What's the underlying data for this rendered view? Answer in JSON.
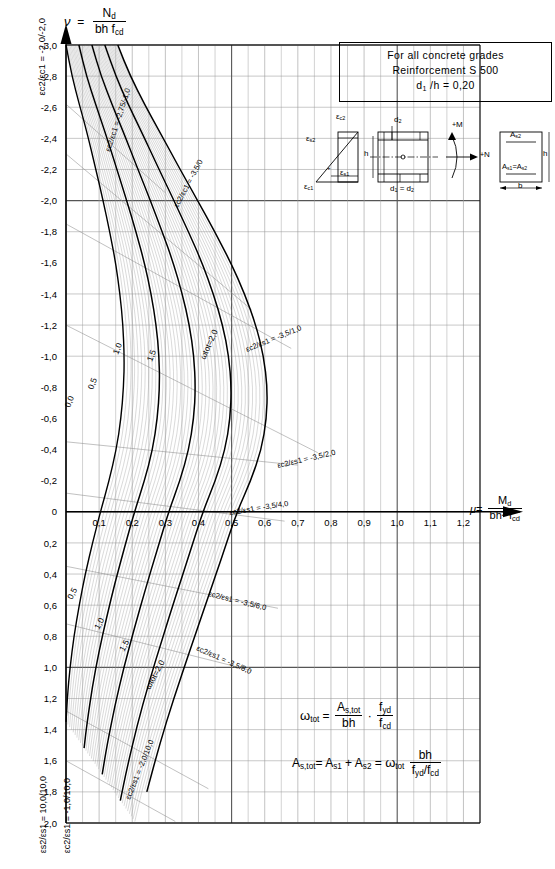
{
  "chart_data": {
    "type": "line",
    "xlabel": "mu = Md / (b h^2 fcd)",
    "ylabel": "nu = Nd / (b h fcd)",
    "xlim": [
      0,
      1.25
    ],
    "ylim": [
      -3.0,
      2.0
    ],
    "grid": true,
    "x_ticks": [
      "0,1",
      "0,2",
      "0,3",
      "0,4",
      "0,5",
      "0,6",
      "0,7",
      "0,8",
      "0,9",
      "1,0",
      "1,1",
      "1,2"
    ],
    "x_tick_values": [
      0.1,
      0.2,
      0.3,
      0.4,
      0.5,
      0.6,
      0.7,
      0.8,
      0.9,
      1.0,
      1.1,
      1.2
    ],
    "y_ticks": [
      "-3,0",
      "-2,8",
      "-2,6",
      "-2,4",
      "-2,2",
      "-2,0",
      "-1,8",
      "-1,6",
      "-1,4",
      "-1,2",
      "-1,0",
      "-0,8",
      "-0,6",
      "-0,4",
      "-0,2",
      "0",
      "0,2",
      "0,4",
      "0,6",
      "0,8",
      "1,0",
      "1,2",
      "1,4",
      "1,6",
      "1,8",
      "2,0"
    ],
    "y_tick_values": [
      -3.0,
      -2.8,
      -2.6,
      -2.4,
      -2.2,
      -2.0,
      -1.8,
      -1.6,
      -1.4,
      -1.2,
      -1.0,
      -0.8,
      -0.6,
      -0.4,
      -0.2,
      0,
      0.2,
      0.4,
      0.6,
      0.8,
      1.0,
      1.2,
      1.4,
      1.6,
      1.8,
      2.0
    ],
    "omega_curves": [
      {
        "label": "0,0",
        "omega": 0.0
      },
      {
        "label": "0,5",
        "omega": 0.5
      },
      {
        "label": "1,0",
        "omega": 1.0
      },
      {
        "label": "1,5",
        "omega": 1.5
      },
      {
        "label": "2,0",
        "omega": 2.0
      }
    ],
    "strain_lines": [
      {
        "label": "εc2/εc1 = -2,0/-2,0"
      },
      {
        "label": "εc2/εc1 = -2,75/-1,0"
      },
      {
        "label": "εc2/εc1 = -3,5/0"
      },
      {
        "label": "εc2/εs1 = -3,5/1,0"
      },
      {
        "label": "εc2/εs1 = -3,5/2,0"
      },
      {
        "label": "εc2/εs1 = -3,5/4,0"
      },
      {
        "label": "εc2/εs1 = -3,5/6,0"
      },
      {
        "label": "εc2/εs1 = -3,5/8,0"
      },
      {
        "label": "εc2/εs1 = -2,0/10,0"
      },
      {
        "label": "εc2/εs1 = -1,0/10,0"
      },
      {
        "label": "εs2/εs1 = 10,0/10,0"
      }
    ]
  },
  "axes": {
    "y_axis_symbol": "ν",
    "y_axis_num": "N",
    "y_axis_num_sub": "d",
    "y_axis_den": "bh f",
    "y_axis_den_sub": "cd",
    "x_axis_symbol": "μ",
    "x_axis_num": "M",
    "x_axis_num_sub": "d",
    "x_axis_den": "bh",
    "x_axis_den_sup": "2",
    "x_axis_den2": " f",
    "x_axis_den_sub": "cd"
  },
  "legend": {
    "line1": "For all concrete grades",
    "line2": "Reinforcement  S 500",
    "line3_a": "d",
    "line3_sub": "1",
    "line3_b": " /h  =  0,20"
  },
  "section_diagram": {
    "strain_top": "ε",
    "eps_c2": "c2",
    "eps_s2": "s2",
    "eps_s1": "s1",
    "eps_c1": "c1",
    "d2_label": "d",
    "d2_sub": "2",
    "h_label": "h",
    "d_label": "d",
    "d1d2_label": "d",
    "d1d2_sub": "1",
    "d1d2_eq": " = d",
    "d1d2_sub2": "2",
    "moment_label": "M",
    "moment_sign": "+",
    "normal_label": "N",
    "normal_sign": "+",
    "as2_label": "A",
    "as2_sub": "s2",
    "as1as2_label": "A",
    "as1_sub": "s1",
    "as1as2_eq": "=A",
    "as2_sub2": "s2",
    "b_label": "b",
    "h_right": "h"
  },
  "formulas": {
    "f1_lhs": "ω",
    "f1_lhs_sub": "tot",
    "f1_eq": "=",
    "f1_num1": "A",
    "f1_num1_sub": "s,tot",
    "f1_den1": "bh",
    "f1_dot": "·",
    "f1_num2": "f",
    "f1_num2_sub": "yd",
    "f1_den2": "f",
    "f1_den2_sub": "cd",
    "f2_lhs": "A",
    "f2_lhs_sub": "s,tot",
    "f2_eq1": "=",
    "f2_t1": "A",
    "f2_t1_sub": "s1",
    "f2_plus": "+",
    "f2_t2": "A",
    "f2_t2_sub": "s2",
    "f2_eq2": "=",
    "f2_omega": "ω",
    "f2_omega_sub": "tot",
    "f2_num": "bh",
    "f2_den": "f",
    "f2_den_sub1": "yd",
    "f2_den_mid": "/f",
    "f2_den_sub2": "cd"
  },
  "colors": {
    "ink": "#000000",
    "grid_major": "#555555",
    "grid_minor": "#9a9a9a",
    "hatch": "#8d8d8d",
    "background": "#ffffff"
  }
}
